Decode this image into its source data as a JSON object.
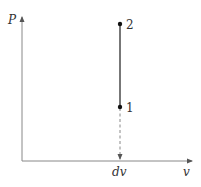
{
  "diagram": {
    "axes": {
      "y_label": "P",
      "x_label": "v",
      "x_tick_label": "dv"
    },
    "points": [
      {
        "label": "1",
        "x": 120,
        "y": 107
      },
      {
        "label": "2",
        "x": 120,
        "y": 24
      }
    ],
    "process_line": {
      "from": "1",
      "to": "2",
      "style": "solid"
    },
    "projection_line": {
      "from": "1",
      "to": "dv",
      "style": "dashed"
    },
    "colors": {
      "axis": "#777777",
      "line": "#555555",
      "point": "#111111"
    }
  }
}
